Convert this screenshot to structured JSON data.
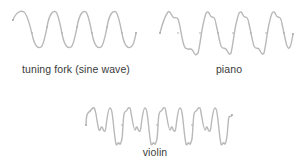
{
  "figure": {
    "panels": [
      {
        "id": "tuning-fork",
        "label": "tuning fork (sine wave)",
        "waveform": "sine",
        "cycles": 4,
        "stroke_color": "#b9b9b9"
      },
      {
        "id": "piano",
        "label": "piano",
        "waveform": "complex-periodic",
        "cycles": 4,
        "stroke_color": "#b9b9b9"
      },
      {
        "id": "violin",
        "label": "violin",
        "waveform": "complex-periodic-rich-harmonics",
        "cycles": 4,
        "stroke_color": "#b9b9b9"
      }
    ],
    "label_color": "#3a3a3a",
    "background": "#ffffff"
  }
}
